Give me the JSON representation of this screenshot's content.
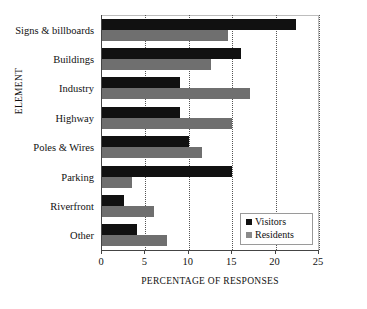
{
  "chart_data": {
    "type": "bar",
    "orientation": "horizontal",
    "title": "",
    "xlabel": "PERCENTAGE OF RESPONSES",
    "ylabel": "ELEMENT",
    "xlim": [
      0,
      25
    ],
    "xticks": [
      0,
      5,
      10,
      15,
      20,
      25
    ],
    "grid": "vertical-dotted",
    "legend_position": "bottom-right",
    "categories": [
      "Signs & billboards",
      "Buildings",
      "Industry",
      "Highway",
      "Poles & Wires",
      "Parking",
      "Riverfront",
      "Other"
    ],
    "series": [
      {
        "name": "Visitors",
        "color": "#111111",
        "values": [
          22.3,
          16.0,
          9.0,
          9.0,
          10.0,
          15.0,
          2.5,
          4.0
        ]
      },
      {
        "name": "Residents",
        "color": "#6f6f6f",
        "values": [
          14.5,
          12.5,
          17.0,
          15.0,
          11.5,
          3.5,
          6.0,
          7.5
        ]
      }
    ]
  },
  "legend": {
    "entries": [
      {
        "label": "Visitors",
        "swatch": "black-square"
      },
      {
        "label": "Residents",
        "swatch": "gray-square"
      }
    ]
  }
}
